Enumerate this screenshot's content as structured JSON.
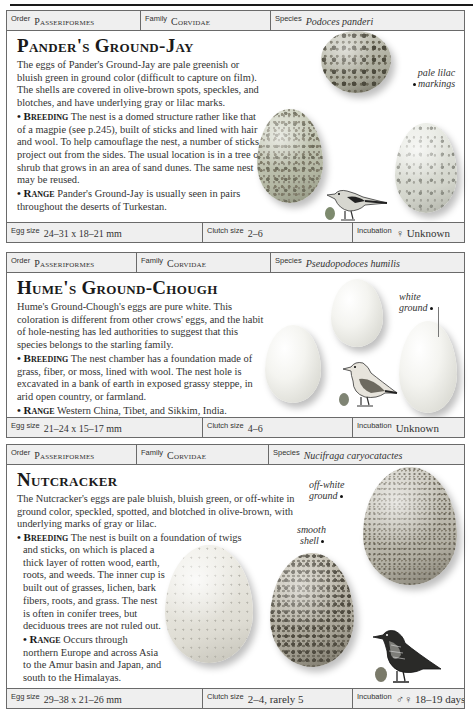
{
  "entries": [
    {
      "order_label": "Order",
      "order": "Passeriformes",
      "family_label": "Family",
      "family": "Corvidae",
      "species_label": "Species",
      "species": "Podoces panderi",
      "title": "Pander's Ground-Jay",
      "description": "The eggs of Pander's Ground-Jay are pale greenish or bluish green in ground color (difficult to capture on film). The shells are covered in olive-brown spots, speckles, and blotches, and have underlying gray or lilac marks.",
      "breeding_label": "• Breeding",
      "breeding": " The nest is a domed structure rather like that of a magpie (see p.245), built of sticks and lined with hair and wool. To help camouflage the nest, a number of sticks project out from the sides. The usual location is in a tree or shrub that grows in an area of sand dunes. The same nest may be reused.",
      "range_label": "• Range",
      "range": " Pander's Ground-Jay is usually seen in pairs throughout the deserts of Turkestan.",
      "annotations": [
        "pale lilac",
        "markings"
      ],
      "egg_size_label": "Egg size",
      "egg_size": "24–31 x 18–21 mm",
      "clutch_size_label": "Clutch size",
      "clutch_size": "2–6",
      "incubation_label": "Incubation",
      "incubation": "♀ Unknown"
    },
    {
      "order_label": "Order",
      "order": "Passeriformes",
      "family_label": "Family",
      "family": "Corvidae",
      "species_label": "Species",
      "species": "Pseudopodoces humilis",
      "title": "Hume's Ground-Chough",
      "description": "Hume's Ground-Chough's eggs are pure white. This coloration is different from other crows' eggs, and the habit of hole-nesting has led authorities to suggest that this species belongs to the starling family.",
      "breeding_label": "• Breeding",
      "breeding": " The nest chamber has a foundation made of grass, fiber, or moss, lined with wool. The nest hole is excavated in a bank of earth in exposed grassy steppe, in arid open country, or farmland.",
      "range_label": "• Range",
      "range": " Western China, Tibet, and Sikkim, India.",
      "annotations": [
        "white",
        "ground"
      ],
      "egg_size_label": "Egg size",
      "egg_size": "21–24 x 15–17 mm",
      "clutch_size_label": "Clutch size",
      "clutch_size": "4–6",
      "incubation_label": "Incubation",
      "incubation": "Unknown"
    },
    {
      "order_label": "Order",
      "order": "Passeriformes",
      "family_label": "Family",
      "family": "Corvidae",
      "species_label": "Species",
      "species": "Nucifraga caryocatactes",
      "title": "Nutcracker",
      "description": "The Nutcracker's eggs are pale bluish, bluish green, or off-white in ground color, speckled, spotted, and blotched in olive-brown, with underlying marks of gray or lilac.",
      "breeding_label": "• Breeding",
      "breeding_line1": " The nest is built on a foundation of twigs",
      "breeding_rest": "and sticks, on which is placed a thick layer of rotten wood, earth, roots, and weeds. The inner cup is built out of grasses, lichen, bark fibers, roots, and grass. The nest is often in conifer trees, but deciduous trees are not ruled out.",
      "range_label": "• Range",
      "range": " Occurs through northern Europe and across Asia to the Amur basin and Japan, and south to the Himalayas.",
      "annotations": [
        "off-white",
        "ground",
        "smooth",
        "shell"
      ],
      "egg_size_label": "Egg size",
      "egg_size": "29–38 x 21–26 mm",
      "clutch_size_label": "Clutch size",
      "clutch_size": "2–4, rarely 5",
      "incubation_label": "Incubation",
      "incubation": "♂♀ 18–19 days"
    }
  ],
  "colors": {
    "border": "#6a6a6a",
    "header_bg": "#efefef",
    "text": "#333333",
    "title": "#1a1a1a",
    "mini_egg_1": "#7d8a6e",
    "mini_egg_2": "#7f8474",
    "mini_egg_3": "#7a7a6a"
  }
}
